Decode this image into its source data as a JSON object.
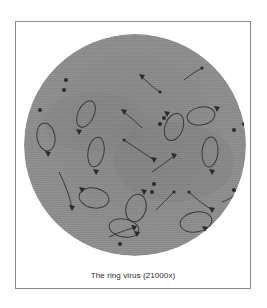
{
  "figure": {
    "caption": "The ring virus (21000x)",
    "colors": {
      "background": "#ffffff",
      "frame_border": "#8a8a8a",
      "disk": "#8e8e8e",
      "disk_shade": "#7c7c7c",
      "virus": "#2b2b2b"
    },
    "disk": {
      "cx": 111,
      "cy": 113,
      "r": 111
    },
    "loops": [
      {
        "cx": 22,
        "cy": 105,
        "rx": 9,
        "ry": 14,
        "rot": -10,
        "head": [
          24,
          122
        ]
      },
      {
        "cx": 70,
        "cy": 166,
        "rx": 15,
        "ry": 10,
        "rot": 10,
        "head": [
          58,
          158
        ]
      },
      {
        "cx": 112,
        "cy": 176,
        "rx": 10,
        "ry": 14,
        "rot": 15,
        "head": [
          120,
          160
        ]
      },
      {
        "cx": 177,
        "cy": 84,
        "rx": 14,
        "ry": 9,
        "rot": -10,
        "head": [
          193,
          77
        ]
      },
      {
        "cx": 186,
        "cy": 120,
        "rx": 8,
        "ry": 15,
        "rot": 5,
        "head": [
          188,
          140
        ]
      },
      {
        "cx": 100,
        "cy": 196,
        "rx": 15,
        "ry": 9,
        "rot": 10,
        "head": [
          113,
          202
        ]
      },
      {
        "cx": 172,
        "cy": 190,
        "rx": 16,
        "ry": 10,
        "rot": -10,
        "head": [
          181,
          197
        ]
      },
      {
        "cx": 150,
        "cy": 95,
        "rx": 9,
        "ry": 14,
        "rot": 20,
        "head": [
          143,
          82
        ]
      },
      {
        "cx": 72,
        "cy": 120,
        "rx": 8,
        "ry": 15,
        "rot": 10,
        "head": [
          72,
          140
        ]
      },
      {
        "cx": 62,
        "cy": 82,
        "rx": 8,
        "ry": 14,
        "rot": 25,
        "head": [
          55,
          100
        ]
      },
      {
        "cx": 188,
        "cy": 210,
        "rx": 10,
        "ry": 13,
        "rot": 0,
        "head": [
          192,
          200
        ]
      }
    ],
    "tails": [
      {
        "d": "M100 108 Q118 120 130 128",
        "head": [
          130,
          128
        ],
        "dot": [
          100,
          108
        ]
      },
      {
        "d": "M128 140 Q140 132 150 124",
        "head": [
          150,
          124
        ]
      },
      {
        "d": "M35 140 Q45 160 48 176",
        "head": [
          48,
          176
        ]
      },
      {
        "d": "M118 45 Q128 55 136 60",
        "head": [
          118,
          45
        ],
        "dot": [
          136,
          60
        ]
      },
      {
        "d": "M160 48 Q170 40 178 36",
        "dot": [
          178,
          36
        ]
      },
      {
        "d": "M100 80 Q110 88 118 96",
        "head": [
          100,
          80
        ]
      },
      {
        "d": "M165 160 Q175 170 188 178",
        "head": [
          188,
          178
        ],
        "dot": [
          165,
          160
        ]
      },
      {
        "d": "M85 205 Q100 198 110 196",
        "head": [
          110,
          196
        ]
      },
      {
        "d": "M215 160 Q205 168 198 170",
        "head": [
          214,
          162
        ]
      },
      {
        "d": "M150 160 Q140 170 132 178",
        "dot": [
          150,
          160
        ]
      }
    ],
    "blobs": [
      [
        40,
        58
      ],
      [
        16,
        78
      ],
      [
        4,
        150
      ],
      [
        18,
        182
      ],
      [
        50,
        218
      ],
      [
        210,
        98
      ],
      [
        220,
        92
      ],
      [
        140,
        86
      ],
      [
        136,
        92
      ],
      [
        128,
        160
      ],
      [
        130,
        152
      ],
      [
        96,
        212
      ],
      [
        210,
        158
      ],
      [
        42,
        48
      ]
    ]
  }
}
